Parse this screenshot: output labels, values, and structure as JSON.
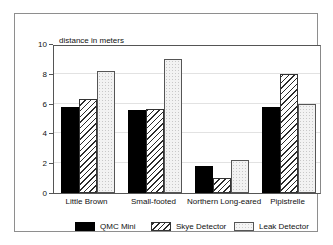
{
  "chart_data": {
    "type": "bar",
    "title": "distance in meters",
    "xlabel": "",
    "ylabel": "",
    "ylim": [
      0,
      10
    ],
    "yticks": [
      0,
      2,
      4,
      6,
      8,
      10
    ],
    "grid": true,
    "legend_position": "bottom",
    "categories": [
      "Little Brown",
      "Small-footed",
      "Northern Long-eared",
      "Pipistrelle"
    ],
    "series": [
      {
        "name": "QMC Mini",
        "values": [
          5.8,
          5.6,
          1.8,
          5.8
        ],
        "fill": "solid-black",
        "color": "#000000"
      },
      {
        "name": "Skye Detector",
        "values": [
          6.3,
          5.65,
          1.0,
          8.0
        ],
        "fill": "diagonal-hatch",
        "color": "#2b2b2b"
      },
      {
        "name": "Leak Detector",
        "values": [
          8.2,
          9.0,
          2.2,
          6.0
        ],
        "fill": "dotted-light",
        "color": "#f2f2f2"
      }
    ]
  },
  "figure": {
    "background_color": "#ffffff",
    "frame_color": "#8e8e8e",
    "axis_color": "#555555",
    "gridline_color": "#e2e2e2"
  }
}
